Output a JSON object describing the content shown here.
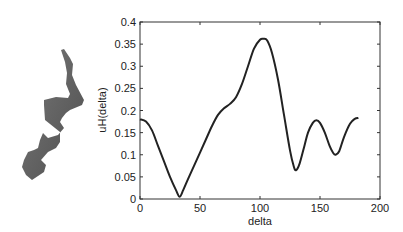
{
  "figure": {
    "shape_name": "helix-silhouette"
  },
  "chart_data": {
    "type": "line",
    "title": "",
    "xlabel": "delta",
    "ylabel": "uH(delta)",
    "xlim": [
      0,
      200
    ],
    "ylim": [
      0,
      0.4
    ],
    "xticks": [
      0,
      50,
      100,
      150,
      200
    ],
    "xtick_labels": [
      "0",
      "50",
      "100",
      "150",
      "200"
    ],
    "yticks": [
      0,
      0.05,
      0.1,
      0.15,
      0.2,
      0.25,
      0.3,
      0.35,
      0.4
    ],
    "ytick_labels": [
      "0",
      "0.05",
      "0.1",
      "0.15",
      "0.2",
      "0.25",
      "0.3",
      "0.35",
      "0.4"
    ],
    "grid": false,
    "legend": "none",
    "series": [
      {
        "name": "uH(delta)",
        "color": "#222222",
        "x": [
          0,
          5,
          10,
          15,
          20,
          25,
          30,
          33,
          36,
          40,
          45,
          50,
          55,
          60,
          65,
          70,
          75,
          80,
          85,
          90,
          95,
          100,
          103,
          106,
          110,
          115,
          120,
          125,
          128,
          130,
          133,
          137,
          140,
          144,
          147,
          150,
          154,
          158,
          161,
          163,
          166,
          170,
          175,
          179,
          182
        ],
        "y": [
          0.18,
          0.175,
          0.155,
          0.12,
          0.085,
          0.05,
          0.02,
          0.005,
          0.02,
          0.045,
          0.075,
          0.105,
          0.135,
          0.165,
          0.19,
          0.205,
          0.215,
          0.23,
          0.26,
          0.3,
          0.34,
          0.36,
          0.362,
          0.358,
          0.33,
          0.27,
          0.19,
          0.11,
          0.075,
          0.065,
          0.08,
          0.12,
          0.15,
          0.172,
          0.178,
          0.172,
          0.15,
          0.12,
          0.104,
          0.1,
          0.108,
          0.14,
          0.17,
          0.181,
          0.183
        ]
      }
    ]
  }
}
